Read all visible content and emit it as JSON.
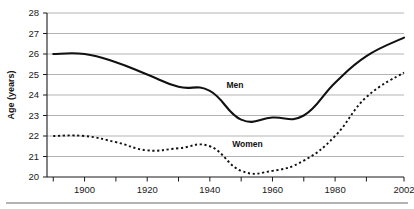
{
  "chart_data": {
    "type": "line",
    "title": "",
    "subtitle": "",
    "xlabel": "",
    "ylabel": "Age (years)",
    "xlim": [
      1888,
      2002
    ],
    "ylim": [
      20,
      28
    ],
    "grid": true,
    "grid_axis": "y",
    "legend_position": "inline-annotation",
    "y_ticks": [
      20,
      21,
      22,
      23,
      24,
      25,
      26,
      27,
      28
    ],
    "y_tick_labels": [
      "20",
      "21",
      "22",
      "23",
      "24",
      "25",
      "26",
      "27",
      "28"
    ],
    "x_ticks": [
      1890,
      1900,
      1910,
      1920,
      1930,
      1940,
      1950,
      1960,
      1970,
      1980,
      1990,
      2002
    ],
    "x_tick_labels": [
      "",
      "1900",
      "",
      "1920",
      "",
      "1940",
      "",
      "1960",
      "",
      "1980",
      "",
      "2002"
    ],
    "x_labeled_ticks": [
      {
        "value": 1900,
        "label": "1900"
      },
      {
        "value": 1920,
        "label": "1920"
      },
      {
        "value": 1940,
        "label": "1940"
      },
      {
        "value": 1960,
        "label": "1960"
      },
      {
        "value": 1980,
        "label": "1980"
      },
      {
        "value": 2002,
        "label": "2002"
      }
    ],
    "series": [
      {
        "name": "Men",
        "label": "Men",
        "style": "solid",
        "color": "#111111",
        "width": 2.1,
        "annotation": {
          "text": "Men",
          "x": 1948,
          "y": 24.35
        },
        "x": [
          1890,
          1900,
          1910,
          1920,
          1930,
          1940,
          1950,
          1960,
          1970,
          1980,
          1990,
          2002
        ],
        "values": [
          26.0,
          26.0,
          25.6,
          25.0,
          24.4,
          24.2,
          22.8,
          22.9,
          23.0,
          24.6,
          25.9,
          26.8
        ]
      },
      {
        "name": "Women",
        "label": "Women",
        "style": "dotted",
        "color": "#111111",
        "width": 1.9,
        "annotation": {
          "text": "Women",
          "x": 1952,
          "y": 21.45
        },
        "x": [
          1890,
          1900,
          1910,
          1920,
          1930,
          1940,
          1950,
          1960,
          1970,
          1980,
          1990,
          2002
        ],
        "values": [
          22.0,
          22.0,
          21.7,
          21.3,
          21.4,
          21.5,
          20.3,
          20.3,
          20.8,
          22.0,
          23.9,
          25.1
        ]
      }
    ]
  }
}
